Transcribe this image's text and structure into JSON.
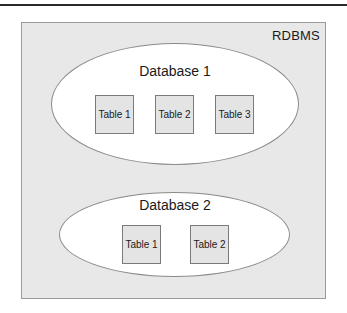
{
  "diagram": {
    "container": {
      "label": "RDBMS",
      "fill": "#e8e8e8",
      "border": "#9a9a9a"
    },
    "databases": [
      {
        "label": "Database 1",
        "tables": [
          {
            "label": "Table 1"
          },
          {
            "label": "Table 2"
          },
          {
            "label": "Table 3"
          }
        ]
      },
      {
        "label": "Database 2",
        "tables": [
          {
            "label": "Table 1"
          },
          {
            "label": "Table 2"
          }
        ]
      }
    ],
    "colors": {
      "ellipse_fill": "#ffffff",
      "table_fill": "#e4e4e4",
      "text": "#1a1a1a"
    }
  }
}
